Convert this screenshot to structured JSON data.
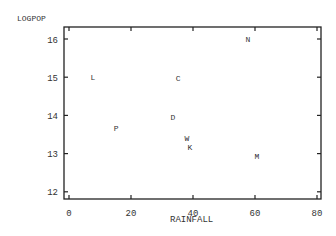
{
  "chart_data": {
    "type": "scatter",
    "title": "",
    "xlabel": "RAINFALL",
    "ylabel": "LOGPOP",
    "xlim": [
      -1.5,
      81.5
    ],
    "ylim": [
      11.8,
      16.3
    ],
    "xticks": [
      0,
      20,
      40,
      60,
      80
    ],
    "yticks": [
      12,
      13,
      14,
      15,
      16
    ],
    "grid": false,
    "legend": null,
    "marker": "letter",
    "points": [
      {
        "label": "N",
        "x": 57.7,
        "y": 16.0
      },
      {
        "label": "L",
        "x": 7.7,
        "y": 15.0
      },
      {
        "label": "C",
        "x": 35.2,
        "y": 14.97
      },
      {
        "label": "D",
        "x": 33.5,
        "y": 13.95
      },
      {
        "label": "P",
        "x": 15.2,
        "y": 13.66
      },
      {
        "label": "W",
        "x": 38.0,
        "y": 13.4
      },
      {
        "label": "K",
        "x": 39.0,
        "y": 13.17
      },
      {
        "label": "M",
        "x": 60.6,
        "y": 12.93
      }
    ]
  },
  "axes": {
    "xlabel": "RAINFALL",
    "ylabel": "LOGPOP"
  }
}
